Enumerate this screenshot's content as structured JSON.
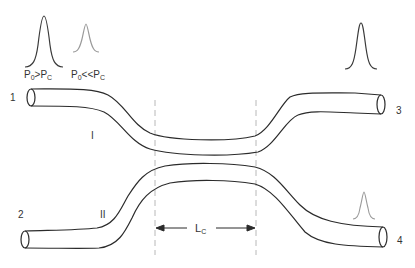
{
  "diagram": {
    "type": "directional-coupler",
    "colors": {
      "line": "#2b2b2b",
      "pulse_strong": "#3a3a3a",
      "pulse_weak": "#9a9a9a",
      "guide": "#b0b0b0"
    },
    "pulses": {
      "input_high": {
        "label_main": "P",
        "label_sub1": "0",
        "label_op": ">P",
        "label_sub2": "C",
        "intensity": "strong"
      },
      "input_low": {
        "label_main": "P",
        "label_sub1": "0",
        "label_op": "<<P",
        "label_sub2": "C",
        "intensity": "weak"
      },
      "output_port3": {
        "intensity": "strong"
      },
      "output_port4": {
        "intensity": "weak"
      }
    },
    "ports": {
      "p1": "1",
      "p2": "2",
      "p3": "3",
      "p4": "4"
    },
    "arms": {
      "upper": "I",
      "lower": "II"
    },
    "coupling_length": {
      "label_main": "L",
      "label_sub": "C"
    }
  }
}
